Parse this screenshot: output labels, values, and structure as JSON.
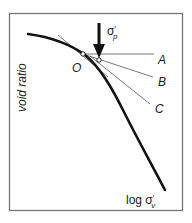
{
  "diagram": {
    "type": "casagrande-preconsolidation-construction",
    "y_axis_label": "void ratio",
    "x_axis_label_main": "log σ",
    "x_axis_label_prime": "′",
    "x_axis_label_sub": "v",
    "stress_label_main": "σ",
    "stress_label_prime": "′",
    "stress_label_sub": "p",
    "point_o_label": "O",
    "line_labels": [
      "A",
      "B",
      "C"
    ],
    "colors": {
      "curve": "#111111",
      "construction_lines": "#555555",
      "frame": "#777777",
      "background": "#ffffff"
    }
  }
}
